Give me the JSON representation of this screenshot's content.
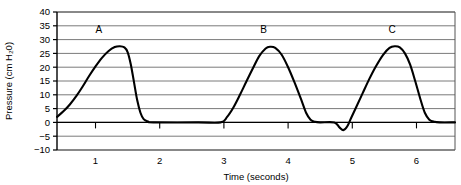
{
  "chart_data": {
    "type": "line",
    "title": "",
    "subtitle": "",
    "xlabel": "Time (seconds)",
    "ylabel": "Pressure (cm H₂0)",
    "xlim": [
      0.4,
      6.6
    ],
    "ylim": [
      -10,
      40
    ],
    "xticks": [
      1,
      2,
      3,
      4,
      5,
      6
    ],
    "xtick_labels": [
      "1",
      "2",
      "3",
      "4",
      "5",
      "6"
    ],
    "yticks": [
      -10,
      -5,
      0,
      5,
      10,
      15,
      20,
      25,
      30,
      35,
      40
    ],
    "ytick_labels": [
      "−10",
      "−5",
      "0",
      "5",
      "10",
      "15",
      "20",
      "25",
      "30",
      "35",
      "40"
    ],
    "grid": "horizontal",
    "grid_color": "#7a7a7a",
    "line_color": "#000000",
    "legend": "none",
    "annotations": [
      {
        "label": "A",
        "x": 1.05,
        "y": 32.5
      },
      {
        "label": "B",
        "x": 3.62,
        "y": 32.5
      },
      {
        "label": "C",
        "x": 5.62,
        "y": 32.5
      }
    ],
    "series": [
      {
        "name": "Airway pressure",
        "points": [
          [
            0.4,
            2.0
          ],
          [
            0.5,
            4.0
          ],
          [
            0.6,
            6.5
          ],
          [
            0.7,
            9.5
          ],
          [
            0.8,
            13.0
          ],
          [
            0.9,
            16.8
          ],
          [
            1.0,
            20.3
          ],
          [
            1.1,
            23.4
          ],
          [
            1.2,
            25.8
          ],
          [
            1.3,
            27.3
          ],
          [
            1.38,
            27.6
          ],
          [
            1.45,
            27.2
          ],
          [
            1.5,
            25.5
          ],
          [
            1.55,
            21.0
          ],
          [
            1.6,
            14.5
          ],
          [
            1.65,
            8.0
          ],
          [
            1.7,
            3.5
          ],
          [
            1.75,
            1.2
          ],
          [
            1.82,
            0.3
          ],
          [
            1.9,
            0.0
          ],
          [
            2.6,
            0.0
          ],
          [
            2.95,
            0.0
          ],
          [
            3.05,
            2.0
          ],
          [
            3.15,
            5.5
          ],
          [
            3.25,
            10.0
          ],
          [
            3.35,
            14.8
          ],
          [
            3.45,
            19.5
          ],
          [
            3.55,
            24.0
          ],
          [
            3.65,
            26.8
          ],
          [
            3.72,
            27.4
          ],
          [
            3.8,
            27.0
          ],
          [
            3.9,
            24.5
          ],
          [
            4.0,
            20.0
          ],
          [
            4.1,
            14.5
          ],
          [
            4.2,
            8.5
          ],
          [
            4.28,
            3.5
          ],
          [
            4.35,
            1.0
          ],
          [
            4.42,
            0.2
          ],
          [
            4.5,
            0.0
          ],
          [
            4.72,
            0.0
          ],
          [
            4.8,
            -1.8
          ],
          [
            4.86,
            -2.8
          ],
          [
            4.92,
            -1.5
          ],
          [
            4.98,
            1.5
          ],
          [
            5.06,
            5.5
          ],
          [
            5.16,
            10.5
          ],
          [
            5.26,
            15.5
          ],
          [
            5.36,
            20.0
          ],
          [
            5.48,
            24.5
          ],
          [
            5.58,
            27.0
          ],
          [
            5.66,
            27.6
          ],
          [
            5.74,
            27.2
          ],
          [
            5.82,
            25.0
          ],
          [
            5.9,
            21.0
          ],
          [
            5.98,
            15.0
          ],
          [
            6.06,
            8.5
          ],
          [
            6.13,
            3.5
          ],
          [
            6.2,
            1.0
          ],
          [
            6.28,
            0.2
          ],
          [
            6.36,
            0.0
          ],
          [
            6.6,
            0.0
          ]
        ]
      }
    ]
  },
  "axes": {
    "y_title": "Pressure (cm H₂0)",
    "x_title": "Time (seconds)"
  }
}
